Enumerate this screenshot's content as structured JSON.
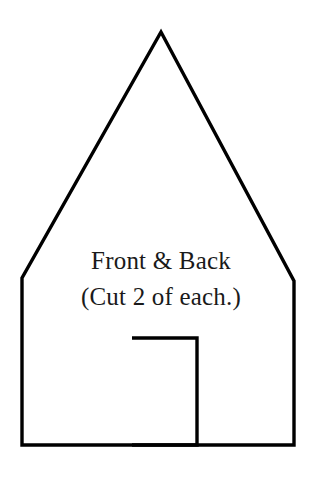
{
  "document": {
    "title": "Front & Back pattern piece",
    "background_color": "#ffffff",
    "stroke_color": "#000000",
    "text_color": "#1a1a1a"
  },
  "pattern": {
    "shape_name": "house-outline",
    "outline_points": "161,32 294,281 294,445 22,445 22,278",
    "door_points": "132,338 197,338 197,445 132,445",
    "stroke_width": "3.4",
    "door_stroke_width": "3.4"
  },
  "labels": {
    "line_1": "Front & Back",
    "line_2": "(Cut 2 of each.)"
  }
}
